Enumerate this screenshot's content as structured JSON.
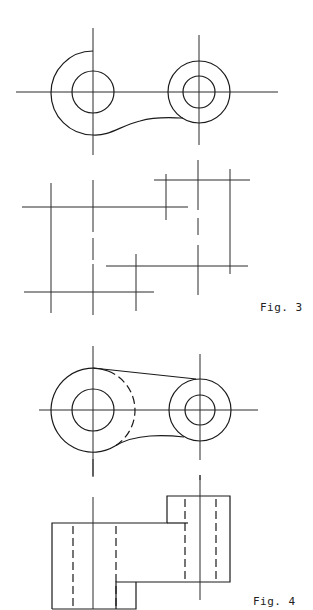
{
  "figures": [
    {
      "id": "fig3",
      "label": "Fig. 3",
      "description": "Incomplete two-view drawing of a link: top view with two bosses, front view showing only center/construction lines"
    },
    {
      "id": "fig4",
      "label": "Fig. 4",
      "description": "Completed two-view drawing of a link: top view with tangent web and hidden arc, front view with stepped blocks and hidden bores"
    }
  ],
  "colors": {
    "line": "#1a1a1a",
    "background": "#ffffff"
  }
}
